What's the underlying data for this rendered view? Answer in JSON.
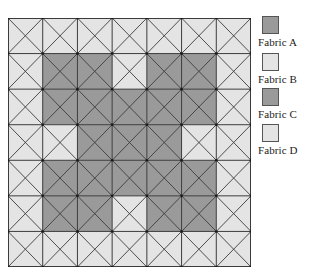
{
  "quilt": {
    "rows": 7,
    "cols": 7,
    "colors": {
      "dark": "#9a9a9a",
      "light": "#e4e4e4",
      "line": "#3c3c3c"
    },
    "pattern": [
      [
        0,
        0,
        0,
        0,
        0,
        0,
        0
      ],
      [
        0,
        1,
        1,
        0,
        1,
        1,
        0
      ],
      [
        0,
        1,
        1,
        1,
        1,
        1,
        0
      ],
      [
        0,
        0,
        1,
        1,
        1,
        0,
        0
      ],
      [
        0,
        1,
        1,
        1,
        1,
        1,
        0
      ],
      [
        0,
        1,
        1,
        0,
        1,
        1,
        0
      ],
      [
        0,
        0,
        0,
        0,
        0,
        0,
        0
      ]
    ],
    "cell_decoration": "diagonal-x"
  },
  "legend": {
    "items": [
      {
        "label": "Fabric A",
        "color": "#9a9a9a"
      },
      {
        "label": "Fabric B",
        "color": "#e4e4e4"
      },
      {
        "label": "Fabric C",
        "color": "#9a9a9a"
      },
      {
        "label": "Fabric D",
        "color": "#e4e4e4"
      }
    ]
  }
}
